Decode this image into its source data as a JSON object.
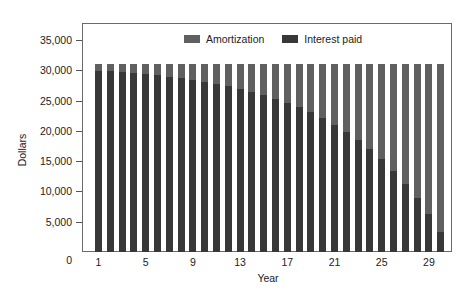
{
  "chart_data": {
    "type": "bar",
    "stacked": true,
    "title": "",
    "xlabel": "Year",
    "ylabel": "Dollars",
    "ylim": [
      0,
      35000
    ],
    "yticks": [
      0,
      5000,
      10000,
      15000,
      20000,
      25000,
      30000,
      35000
    ],
    "ytick_labels": [
      "0",
      "5,000",
      "10,000",
      "15,000",
      "20,000",
      "25,000",
      "30,000",
      "35,000"
    ],
    "xtick_labels": [
      "1",
      "5",
      "9",
      "13",
      "17",
      "21",
      "25",
      "29"
    ],
    "categories": [
      1,
      2,
      3,
      4,
      5,
      6,
      7,
      8,
      9,
      10,
      11,
      12,
      13,
      14,
      15,
      16,
      17,
      18,
      19,
      20,
      21,
      22,
      23,
      24,
      25,
      26,
      27,
      28,
      29,
      30
    ],
    "legend_position": "top",
    "grid": false,
    "series": [
      {
        "name": "Interest paid",
        "color": "#383838",
        "values": [
          29965,
          29841,
          29702,
          29546,
          29372,
          29176,
          28958,
          28712,
          28438,
          28130,
          27786,
          27401,
          26969,
          26485,
          25937,
          25335,
          24654,
          23895,
          23043,
          22089,
          21019,
          19821,
          18480,
          16979,
          15295,
          13406,
          11305,
          8937,
          6279,
          3321
        ]
      },
      {
        "name": "Amortization",
        "color": "#606060",
        "values": [
          1035,
          1159,
          1298,
          1454,
          1628,
          1824,
          2042,
          2288,
          2562,
          2870,
          3214,
          3599,
          4031,
          4515,
          5063,
          5665,
          6346,
          7105,
          7957,
          8911,
          9981,
          11179,
          12520,
          14021,
          15705,
          17594,
          19695,
          22063,
          24721,
          27679
        ]
      }
    ]
  },
  "legend": {
    "items": [
      {
        "label": "Amortization",
        "color": "#606060"
      },
      {
        "label": "Interest paid",
        "color": "#383838"
      }
    ]
  },
  "axes": {
    "y_title": "Dollars",
    "x_title": "Year"
  }
}
